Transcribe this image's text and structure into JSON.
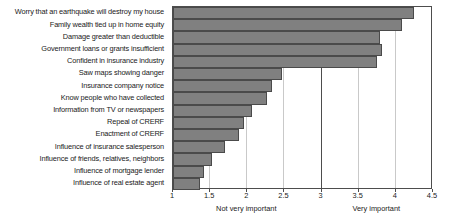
{
  "chart_data": {
    "type": "bar",
    "orientation": "horizontal",
    "title": "",
    "xlabel": "",
    "ylabel": "",
    "xlim": [
      1,
      4.5
    ],
    "xticks": [
      "1",
      "1.5",
      "2",
      "2.5",
      "3",
      "3.5",
      "4",
      "4.5"
    ],
    "xtick_values": [
      1,
      1.5,
      2,
      2.5,
      3,
      3.5,
      4,
      4.5
    ],
    "grid": true,
    "grid_axis": "x",
    "legend": false,
    "bar_color": "#808080",
    "bar_edge_color": "#4a4a4a",
    "axis_color": "#4d4d4d",
    "gridline_color": "#c9c9c9",
    "midline_value": 3,
    "annotations": [
      {
        "text": "Not very important",
        "x": 2.0
      },
      {
        "text": "Very important",
        "x": 3.75
      }
    ],
    "categories": [
      "Worry that an earthquake will destroy my house",
      "Family wealth tied up in home equity",
      "Damage greater than deductible",
      "Government loans or grants insufficient",
      "Confident in insurance industry",
      "Saw maps showing danger",
      "Insurance company notice",
      "Know people who have collected",
      "Information from TV or newspapers",
      "Repeal of CRERF",
      "Enactment of CRERF",
      "Influence of insurance salesperson",
      "Influence of friends, relatives, neighbors",
      "Influence of mortgage lender",
      "Influence of real estate agent"
    ],
    "values": [
      4.25,
      4.08,
      3.79,
      3.81,
      3.74,
      2.47,
      2.33,
      2.26,
      2.07,
      1.95,
      1.89,
      1.7,
      1.52,
      1.42,
      1.37
    ]
  }
}
